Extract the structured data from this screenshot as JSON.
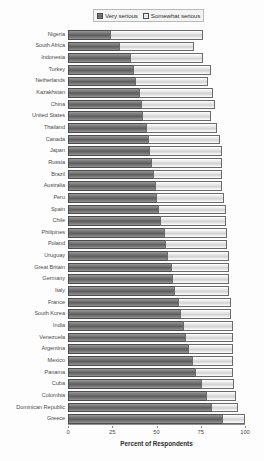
{
  "legend": {
    "position": "top-center",
    "entries": [
      {
        "label": "Very serious",
        "key": "very",
        "swatch": "dark-hatch-swatch",
        "color": "#6d6d6d"
      },
      {
        "label": "Somewhat serious",
        "key": "somewhat",
        "swatch": "light-hatch-swatch",
        "color": "#dcdcdc"
      }
    ]
  },
  "axis": {
    "x_title": "Percent of Respondents",
    "x_ticks": [
      "0",
      "25",
      "50",
      "75",
      "100"
    ],
    "x_min": 0,
    "x_max": 100
  },
  "chart_data": {
    "type": "bar",
    "orientation": "horizontal",
    "stacked": true,
    "title": "",
    "subtitle": "",
    "xlabel": "Percent of Respondents",
    "ylabel": "",
    "xlim": [
      0,
      100
    ],
    "grid": false,
    "legend_position": "top-center",
    "categories": [
      "Nigeria",
      "South Africa",
      "Indonesia",
      "Turkey",
      "Netherlands",
      "Kazakhstan",
      "China",
      "United States",
      "Thailand",
      "Canada",
      "Japan",
      "Russia",
      "Brazil",
      "Australia",
      "Peru",
      "Spain",
      "Chile",
      "Philipines",
      "Poland",
      "Uruguay",
      "Great Britain",
      "Germany",
      "Italy",
      "France",
      "South Korea",
      "India",
      "Venezuela",
      "Argentina",
      "Mexico",
      "Panama",
      "Cuba",
      "Colombia",
      "Dominican Republic",
      "Greece"
    ],
    "series": [
      {
        "name": "Very serious",
        "color": "#6d6d6d",
        "values": [
          24,
          29,
          35,
          37,
          38,
          40,
          41,
          42,
          44,
          45,
          46,
          47,
          48,
          49,
          50,
          51,
          52,
          54,
          55,
          56,
          58,
          59,
          60,
          62,
          63,
          65,
          66,
          68,
          70,
          72,
          75,
          78,
          81,
          87
        ]
      },
      {
        "name": "Somewhat serious",
        "color": "#dcdcdc",
        "values": [
          52,
          42,
          41,
          44,
          41,
          42,
          42,
          39,
          40,
          41,
          41,
          40,
          39,
          38,
          38,
          38,
          37,
          36,
          35,
          35,
          33,
          32,
          31,
          30,
          29,
          28,
          27,
          25,
          23,
          21,
          19,
          17,
          15,
          13
        ]
      }
    ]
  }
}
